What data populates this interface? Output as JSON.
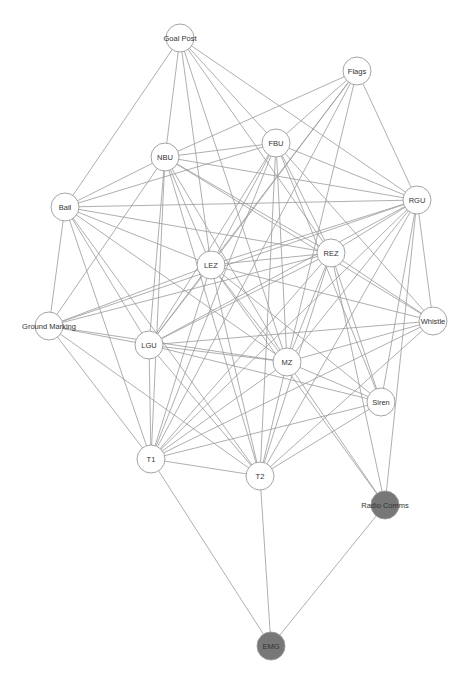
{
  "diagram": {
    "type": "network-graph",
    "node_radius": 14,
    "colors": {
      "node_fill": "#ffffff",
      "highlight_fill": "#777777",
      "edge": "#9a9a9a",
      "node_stroke": "#9a9a9a",
      "label": "#333333"
    },
    "nodes": [
      {
        "id": "GoalPost",
        "label": "Goal Post",
        "x": 180,
        "y": 38,
        "highlight": false
      },
      {
        "id": "Flags",
        "label": "Flags",
        "x": 357,
        "y": 71,
        "highlight": false
      },
      {
        "id": "FBU",
        "label": "FBU",
        "x": 276,
        "y": 143,
        "highlight": false
      },
      {
        "id": "NBU",
        "label": "NBU",
        "x": 165,
        "y": 157,
        "highlight": false
      },
      {
        "id": "Ball",
        "label": "Ball",
        "x": 65,
        "y": 207,
        "highlight": false
      },
      {
        "id": "RGU",
        "label": "RGU",
        "x": 417,
        "y": 200,
        "highlight": false
      },
      {
        "id": "LEZ",
        "label": "LEZ",
        "x": 211,
        "y": 265,
        "highlight": false
      },
      {
        "id": "REZ",
        "label": "REZ",
        "x": 331,
        "y": 253,
        "highlight": false
      },
      {
        "id": "GroundMarking",
        "label": "Ground Marking",
        "x": 49,
        "y": 326,
        "highlight": false
      },
      {
        "id": "Whistle",
        "label": "Whistle",
        "x": 433,
        "y": 321,
        "highlight": false
      },
      {
        "id": "LGU",
        "label": "LGU",
        "x": 149,
        "y": 345,
        "highlight": false
      },
      {
        "id": "MZ",
        "label": "MZ",
        "x": 287,
        "y": 362,
        "highlight": false
      },
      {
        "id": "Siren",
        "label": "Siren",
        "x": 381,
        "y": 402,
        "highlight": false
      },
      {
        "id": "T1",
        "label": "T1",
        "x": 151,
        "y": 459,
        "highlight": false
      },
      {
        "id": "T2",
        "label": "T2",
        "x": 260,
        "y": 476,
        "highlight": false
      },
      {
        "id": "RadioComms",
        "label": "Radio Comms",
        "x": 385,
        "y": 505,
        "highlight": true
      },
      {
        "id": "EMG",
        "label": "EMG",
        "x": 271,
        "y": 646,
        "highlight": true
      }
    ],
    "edges": [
      [
        "GoalPost",
        "Ball"
      ],
      [
        "GoalPost",
        "NBU"
      ],
      [
        "GoalPost",
        "LEZ"
      ],
      [
        "GoalPost",
        "FBU"
      ],
      [
        "GoalPost",
        "MZ"
      ],
      [
        "GoalPost",
        "RGU"
      ],
      [
        "GoalPost",
        "REZ"
      ],
      [
        "Flags",
        "NBU"
      ],
      [
        "Flags",
        "FBU"
      ],
      [
        "Flags",
        "LEZ"
      ],
      [
        "Flags",
        "LGU"
      ],
      [
        "Flags",
        "RGU"
      ],
      [
        "Flags",
        "MZ"
      ],
      [
        "Flags",
        "T1"
      ],
      [
        "FBU",
        "NBU"
      ],
      [
        "FBU",
        "Ball"
      ],
      [
        "FBU",
        "RGU"
      ],
      [
        "FBU",
        "LEZ"
      ],
      [
        "FBU",
        "LGU"
      ],
      [
        "FBU",
        "MZ"
      ],
      [
        "FBU",
        "T1"
      ],
      [
        "FBU",
        "T2"
      ],
      [
        "FBU",
        "REZ"
      ],
      [
        "FBU",
        "Whistle"
      ],
      [
        "FBU",
        "Siren"
      ],
      [
        "NBU",
        "Ball"
      ],
      [
        "NBU",
        "RGU"
      ],
      [
        "NBU",
        "LEZ"
      ],
      [
        "NBU",
        "LGU"
      ],
      [
        "NBU",
        "MZ"
      ],
      [
        "NBU",
        "T1"
      ],
      [
        "NBU",
        "T2"
      ],
      [
        "NBU",
        "REZ"
      ],
      [
        "NBU",
        "Whistle"
      ],
      [
        "NBU",
        "GroundMarking"
      ],
      [
        "Ball",
        "RGU"
      ],
      [
        "Ball",
        "GroundMarking"
      ],
      [
        "Ball",
        "LEZ"
      ],
      [
        "Ball",
        "REZ"
      ],
      [
        "Ball",
        "LGU"
      ],
      [
        "Ball",
        "T1"
      ],
      [
        "Ball",
        "MZ"
      ],
      [
        "Ball",
        "T2"
      ],
      [
        "RGU",
        "LEZ"
      ],
      [
        "RGU",
        "REZ"
      ],
      [
        "RGU",
        "Whistle"
      ],
      [
        "RGU",
        "MZ"
      ],
      [
        "RGU",
        "Siren"
      ],
      [
        "RGU",
        "RadioComms"
      ],
      [
        "RGU",
        "T1"
      ],
      [
        "RGU",
        "T2"
      ],
      [
        "RGU",
        "GroundMarking"
      ],
      [
        "RGU",
        "LGU"
      ],
      [
        "LEZ",
        "REZ"
      ],
      [
        "LEZ",
        "GroundMarking"
      ],
      [
        "LEZ",
        "LGU"
      ],
      [
        "LEZ",
        "MZ"
      ],
      [
        "LEZ",
        "T1"
      ],
      [
        "LEZ",
        "T2"
      ],
      [
        "LEZ",
        "Whistle"
      ],
      [
        "LEZ",
        "Siren"
      ],
      [
        "LEZ",
        "RadioComms"
      ],
      [
        "REZ",
        "GroundMarking"
      ],
      [
        "REZ",
        "Whistle"
      ],
      [
        "REZ",
        "MZ"
      ],
      [
        "REZ",
        "Siren"
      ],
      [
        "REZ",
        "T1"
      ],
      [
        "REZ",
        "T2"
      ],
      [
        "REZ",
        "RadioComms"
      ],
      [
        "REZ",
        "LGU"
      ],
      [
        "GroundMarking",
        "LGU"
      ],
      [
        "GroundMarking",
        "MZ"
      ],
      [
        "GroundMarking",
        "T1"
      ],
      [
        "GroundMarking",
        "T2"
      ],
      [
        "Whistle",
        "LGU"
      ],
      [
        "Whistle",
        "MZ"
      ],
      [
        "Whistle",
        "T1"
      ],
      [
        "Whistle",
        "T2"
      ],
      [
        "LGU",
        "MZ"
      ],
      [
        "LGU",
        "T1"
      ],
      [
        "LGU",
        "T2"
      ],
      [
        "LGU",
        "Siren"
      ],
      [
        "MZ",
        "T1"
      ],
      [
        "MZ",
        "T2"
      ],
      [
        "MZ",
        "Siren"
      ],
      [
        "MZ",
        "RadioComms"
      ],
      [
        "Siren",
        "T1"
      ],
      [
        "Siren",
        "T2"
      ],
      [
        "T1",
        "T2"
      ],
      [
        "T1",
        "EMG"
      ],
      [
        "T2",
        "EMG"
      ],
      [
        "RadioComms",
        "EMG"
      ]
    ]
  }
}
